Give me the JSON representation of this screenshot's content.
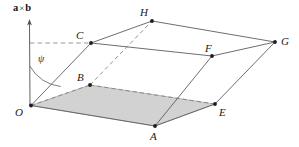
{
  "figure": {
    "width": 299,
    "height": 147,
    "background": "#ffffff",
    "stroke_color": "#5a5a5a",
    "dash_color": "#7a7a7a",
    "shade_fill": "#d2d2d2",
    "shade_stroke": "#8a8a8a",
    "point_color": "#1d1d1d",
    "axis": {
      "label_text_a": "a",
      "label_op": "×",
      "label_text_b": "b",
      "arrow_top_x": 29,
      "arrow_top_y": 20,
      "base_x": 30,
      "base_y": 106
    },
    "angle": {
      "symbol": "ψ",
      "label_x": 38,
      "label_y": 54,
      "arc_radius": 40
    },
    "vertices": [
      {
        "name": "O",
        "x": 31,
        "y": 105.5,
        "label": "O",
        "label_x": 15,
        "label_y": 107
      },
      {
        "name": "A",
        "x": 155,
        "y": 126,
        "label": "A",
        "label_x": 150,
        "label_y": 131
      },
      {
        "name": "B",
        "x": 90,
        "y": 85,
        "label": "B",
        "label_x": 77,
        "label_y": 72
      },
      {
        "name": "C",
        "x": 91,
        "y": 43,
        "label": "C",
        "label_x": 76,
        "label_y": 30
      },
      {
        "name": "E",
        "x": 215,
        "y": 104,
        "label": "E",
        "label_x": 219,
        "label_y": 107
      },
      {
        "name": "F",
        "x": 212,
        "y": 56,
        "label": "F",
        "label_x": 205,
        "label_y": 43
      },
      {
        "name": "G",
        "x": 275,
        "y": 42,
        "label": "G",
        "label_x": 281,
        "label_y": 36
      },
      {
        "name": "H",
        "x": 152,
        "y": 21,
        "label": "H",
        "label_x": 140,
        "label_y": 7
      }
    ],
    "solid_edges": [
      {
        "from": "O",
        "to": "A"
      },
      {
        "from": "A",
        "to": "E"
      },
      {
        "from": "O",
        "to": "C"
      },
      {
        "from": "A",
        "to": "F"
      },
      {
        "from": "E",
        "to": "G"
      },
      {
        "from": "C",
        "to": "H"
      },
      {
        "from": "C",
        "to": "F"
      },
      {
        "from": "H",
        "to": "G"
      },
      {
        "from": "F",
        "to": "G"
      }
    ],
    "dashed_edges": [
      {
        "from": "O",
        "to": "B"
      },
      {
        "from": "B",
        "to": "E"
      },
      {
        "from": "B",
        "to": "H"
      }
    ],
    "dashed_guide": {
      "from_x": 30,
      "from_y": 43,
      "to_x": 91,
      "to_y": 43
    },
    "shaded_face": [
      "O",
      "B",
      "E",
      "A"
    ]
  }
}
